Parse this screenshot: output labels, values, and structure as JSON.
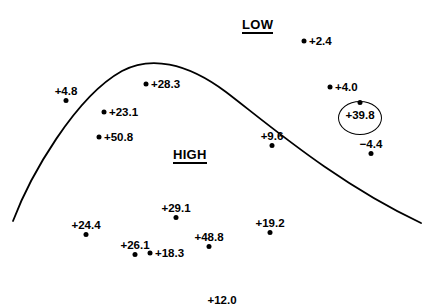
{
  "figure": {
    "type": "annotated-map",
    "width": 432,
    "height": 306,
    "background_color": "#ffffff",
    "ink_color": "#000000"
  },
  "region_labels": [
    {
      "text": "LOW",
      "x": 242,
      "y": 18,
      "underlined": true
    },
    {
      "text": "HIGH",
      "x": 173,
      "y": 148,
      "underlined": true
    }
  ],
  "curve": {
    "name": "ridge-axis-curve",
    "stroke_color": "#000000",
    "stroke_width": 1.8,
    "path": "M 13 221 C 30 176 75 97 122 71 C 150 56 186 62 226 92 C 268 124 336 183 421 223"
  },
  "chart_data": {
    "type": "scatter",
    "title": "",
    "xlabel": "",
    "ylabel": "",
    "annotations": [
      "LOW",
      "HIGH"
    ],
    "values": [
      2.4,
      4.8,
      28.3,
      4.0,
      23.1,
      50.8,
      9.6,
      39.8,
      -4.4,
      29.1,
      24.4,
      19.2,
      26.1,
      48.8,
      18.3,
      12.0
    ],
    "labels": [
      "+2.4",
      "+4.8",
      "+28.3",
      "+4.0",
      "+23.1",
      "+50.8",
      "+9.6",
      "+39.8",
      "−4.4",
      "+29.1",
      "+24.4",
      "+19.2",
      "+26.1",
      "+48.8",
      "+18.3",
      "+12.0"
    ],
    "points": [
      {
        "label": "+2.4",
        "value": 2.4,
        "x": 304,
        "y": 41,
        "label_position": "right"
      },
      {
        "label": "+4.8",
        "value": 4.8,
        "x": 66,
        "y": 85,
        "label_position": "above"
      },
      {
        "label": "+28.3",
        "value": 28.3,
        "x": 146,
        "y": 84,
        "label_position": "right"
      },
      {
        "label": "+4.0",
        "value": 4.0,
        "x": 330,
        "y": 87,
        "label_position": "right"
      },
      {
        "label": "+23.1",
        "value": 23.1,
        "x": 104,
        "y": 112,
        "label_position": "right"
      },
      {
        "label": "+50.8",
        "value": 50.8,
        "x": 99,
        "y": 137,
        "label_position": "right"
      },
      {
        "label": "+9.6",
        "value": 9.6,
        "x": 272,
        "y": 130,
        "label_position": "above"
      },
      {
        "label": "+39.8",
        "value": 39.8,
        "x": 360,
        "y": 109,
        "label_position": "circled",
        "highlighted": true
      },
      {
        "label": "−4.4",
        "value": -4.4,
        "x": 371,
        "y": 138,
        "label_position": "above"
      },
      {
        "label": "+29.1",
        "value": 29.1,
        "x": 176,
        "y": 202,
        "label_position": "above"
      },
      {
        "label": "+24.4",
        "value": 24.4,
        "x": 86,
        "y": 219,
        "label_position": "above"
      },
      {
        "label": "+19.2",
        "value": 19.2,
        "x": 270,
        "y": 217,
        "label_position": "above"
      },
      {
        "label": "+26.1",
        "value": 26.1,
        "x": 135,
        "y": 239,
        "label_position": "above"
      },
      {
        "label": "+48.8",
        "value": 48.8,
        "x": 209,
        "y": 231,
        "label_position": "above"
      },
      {
        "label": "+18.3",
        "value": 18.3,
        "x": 150,
        "y": 253,
        "label_position": "right"
      },
      {
        "label": "+12.0",
        "value": 12.0,
        "x": 222,
        "y": 294,
        "label_position": "above"
      }
    ],
    "highlight": {
      "name": "circled-reading",
      "label": "+39.8",
      "cx": 360,
      "cy": 118,
      "rx": 22,
      "ry": 17
    }
  }
}
